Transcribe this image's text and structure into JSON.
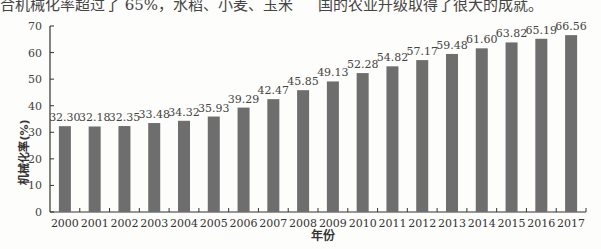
{
  "page": {
    "top_text_left": "合机械化率超过了 65%，水稻、小麦、玉米",
    "top_text_right": "国的农业升级取得了很大的成就。",
    "caption": "图  农作物耕种收综合机械化率"
  },
  "chart_data": {
    "type": "bar",
    "title": "",
    "xlabel": "年份",
    "ylabel": "机械化率(%)",
    "ylim": [
      0,
      70
    ],
    "yticks": [
      0,
      10,
      20,
      30,
      40,
      50,
      60,
      70
    ],
    "grid": false,
    "legend": null,
    "bar_color": "#6e6e6e",
    "categories": [
      "2000",
      "2001",
      "2002",
      "2003",
      "2004",
      "2005",
      "2006",
      "2007",
      "2008",
      "2009",
      "2010",
      "2011",
      "2012",
      "2013",
      "2014",
      "2015",
      "2016",
      "2017"
    ],
    "values": [
      32.3,
      32.18,
      32.35,
      33.48,
      34.32,
      35.93,
      39.29,
      42.47,
      45.85,
      49.13,
      52.28,
      54.82,
      57.17,
      59.48,
      61.6,
      63.82,
      65.19,
      66.56
    ],
    "labels": [
      "32.30",
      "32.18",
      "32.35",
      "33.48",
      "34.32",
      "35.93",
      "39.29",
      "42.47",
      "45.85",
      "49.13",
      "52.28",
      "54.82",
      "57.17",
      "59.48",
      "61.60",
      "63.82",
      "65.19",
      "66.56"
    ]
  }
}
